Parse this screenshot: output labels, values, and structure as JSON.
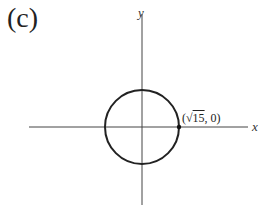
{
  "panel_label": "(c)",
  "axes": {
    "x_label": "x",
    "y_label": "y"
  },
  "point_label": {
    "prefix": "(",
    "radical": "√",
    "radicand": "15",
    "suffix": ", 0)"
  },
  "circle": {
    "center": [
      0,
      0
    ],
    "radius": "√15",
    "equation": "x² + y² = 15"
  },
  "colors": {
    "stroke": "#222222"
  }
}
